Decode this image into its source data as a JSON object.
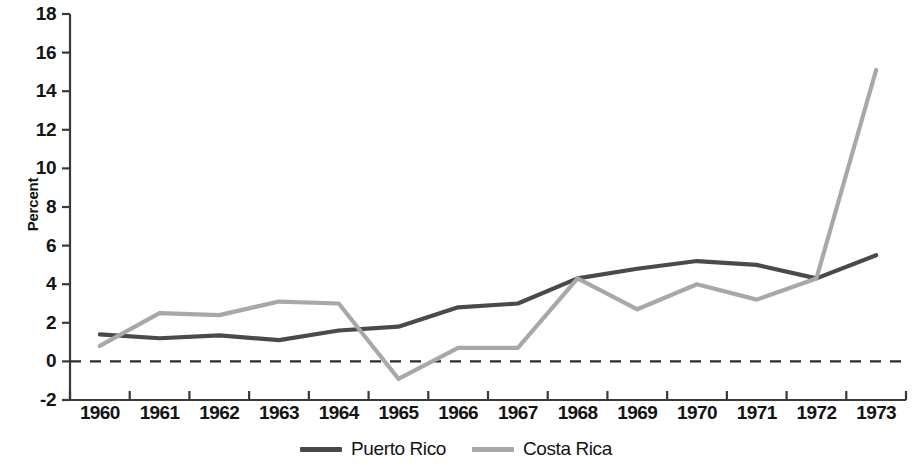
{
  "chart_data": {
    "type": "line",
    "title": "",
    "xlabel": "",
    "ylabel": "Percent",
    "x": [
      1960,
      1961,
      1962,
      1963,
      1964,
      1965,
      1966,
      1967,
      1968,
      1969,
      1970,
      1971,
      1972,
      1973
    ],
    "xtick_labels": [
      "1960",
      "1961",
      "1962",
      "1963",
      "1964",
      "1965",
      "1966",
      "1967",
      "1968",
      "1969",
      "1970",
      "1971",
      "1972",
      "1973"
    ],
    "ytick_labels": [
      "18",
      "16",
      "14",
      "12",
      "10",
      "8",
      "6",
      "4",
      "2",
      "0",
      "-2"
    ],
    "yticks": [
      18,
      16,
      14,
      12,
      10,
      8,
      6,
      4,
      2,
      0,
      -2
    ],
    "ylim": [
      -2,
      18
    ],
    "grid": false,
    "zero_line": true,
    "zero_line_style": "dashed",
    "legend_position": "bottom-center",
    "series": [
      {
        "name": "Puerto Rico",
        "color": "#4a4a4a",
        "values": [
          1.4,
          1.2,
          1.35,
          1.1,
          1.6,
          1.8,
          2.8,
          3.0,
          4.3,
          4.8,
          5.2,
          5.0,
          4.3,
          5.5
        ]
      },
      {
        "name": "Costa Rica",
        "color": "#a8a8a8",
        "values": [
          0.8,
          2.5,
          2.4,
          3.1,
          3.0,
          -0.9,
          0.7,
          0.7,
          4.3,
          2.7,
          4.0,
          3.2,
          4.3,
          15.1
        ]
      }
    ]
  },
  "axis": {
    "ylabel": "Percent"
  },
  "legend": {
    "items": [
      {
        "label": "Puerto Rico",
        "color": "#4a4a4a"
      },
      {
        "label": "Costa Rica",
        "color": "#a8a8a8"
      }
    ]
  }
}
